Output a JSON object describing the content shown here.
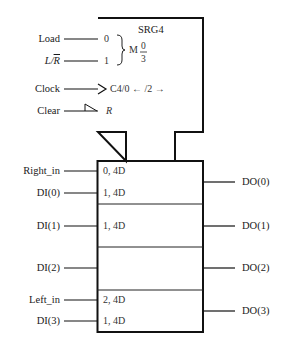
{
  "diagram": {
    "title": "SRG4",
    "control_block": {
      "inputs": [
        {
          "name": "Load",
          "pin": "0"
        },
        {
          "name": "L/R",
          "name_prefix": "L/",
          "name_bar": "R",
          "pin": "1"
        },
        {
          "name": "Clock",
          "pin": "C4/0 ← /2 →",
          "symbol": "clock-triangle"
        },
        {
          "name": "Clear",
          "pin": "R",
          "symbol": "active-low-triangle"
        }
      ],
      "mode_label": "M",
      "mode_num": "0",
      "mode_den": "3"
    },
    "data_block": {
      "rows": [
        {
          "inputs": [
            {
              "name": "Right_in",
              "qual": "0, 4D"
            },
            {
              "name": "DI(0)",
              "qual": "1, 4D"
            }
          ],
          "output": "DO(0)"
        },
        {
          "inputs": [
            {
              "name": "DI(1)",
              "qual": "1, 4D"
            }
          ],
          "output": "DO(1)"
        },
        {
          "inputs": [
            {
              "name": "DI(2)",
              "qual": ""
            }
          ],
          "output": "DO(2)"
        },
        {
          "inputs": [
            {
              "name": "Left_in",
              "qual": "2, 4D"
            },
            {
              "name": "DI(3)",
              "qual": "1, 4D"
            }
          ],
          "output": "DO(3)"
        }
      ]
    },
    "colors": {
      "line": "#111111",
      "text": "#1a1a1a",
      "background": "#ffffff"
    }
  }
}
